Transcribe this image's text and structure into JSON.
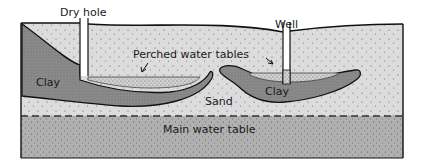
{
  "labels": {
    "dry_hole": "Dry hole",
    "well": "Well",
    "perched": "Perched water tables",
    "clay_left": "Clay",
    "clay_right": "Clay",
    "sand": "Sand",
    "main_water_table": "Main water table"
  },
  "colors": {
    "sand": "#dcdcdc",
    "clay": "#8a8a8a",
    "saturated": "#b0b0b0",
    "perched_water": "#cfcfcf",
    "outline": "#111111",
    "background": "#ffffff"
  }
}
